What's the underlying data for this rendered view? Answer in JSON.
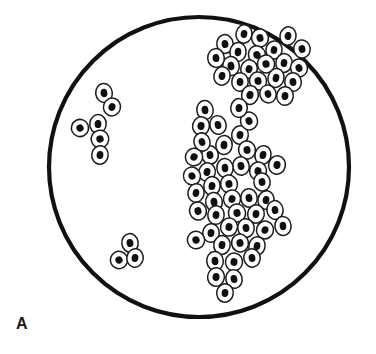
{
  "figure": {
    "panel_label": "A",
    "caption_text": "",
    "canvas": {
      "width": 376,
      "height": 354
    },
    "background_color": "#ffffff"
  },
  "field_of_view": {
    "shape": "circle",
    "center_x": 199,
    "center_y": 167,
    "radius": 150,
    "stroke_color": "#111111",
    "stroke_width": 4.2,
    "fill_color": "#ffffff"
  },
  "cell_style": {
    "membrane_color": "#1b1b1b",
    "membrane_width": 1.5,
    "cytoplasm_color": "#ffffff",
    "nucleus_color": "#101010"
  },
  "clusters": [
    {
      "name": "upper-right-cluster",
      "cell_count": 22,
      "cells": [
        {
          "cx": 225,
          "cy": 44,
          "rx": 8.2,
          "ry": 9.4,
          "rot": -8,
          "nrx": 3.4,
          "nry": 4.1
        },
        {
          "cx": 244,
          "cy": 34,
          "rx": 8.0,
          "ry": 9.2,
          "rot": 12,
          "nrx": 3.3,
          "nry": 4.0
        },
        {
          "cx": 260,
          "cy": 38,
          "rx": 8.4,
          "ry": 9.0,
          "rot": -14,
          "nrx": 3.5,
          "nry": 3.9
        },
        {
          "cx": 238,
          "cy": 52,
          "rx": 8.1,
          "ry": 9.5,
          "rot": 6,
          "nrx": 3.3,
          "nry": 4.2
        },
        {
          "cx": 257,
          "cy": 55,
          "rx": 8.5,
          "ry": 9.3,
          "rot": -20,
          "nrx": 3.6,
          "nry": 4.0
        },
        {
          "cx": 274,
          "cy": 50,
          "rx": 8.0,
          "ry": 9.1,
          "rot": 10,
          "nrx": 3.3,
          "nry": 3.9
        },
        {
          "cx": 231,
          "cy": 66,
          "rx": 8.3,
          "ry": 9.6,
          "rot": -6,
          "nrx": 3.4,
          "nry": 4.2
        },
        {
          "cx": 249,
          "cy": 69,
          "rx": 8.2,
          "ry": 9.2,
          "rot": 16,
          "nrx": 3.4,
          "nry": 4.0
        },
        {
          "cx": 266,
          "cy": 64,
          "rx": 8.6,
          "ry": 8.9,
          "rot": -12,
          "nrx": 3.6,
          "nry": 3.8
        },
        {
          "cx": 284,
          "cy": 63,
          "rx": 8.1,
          "ry": 9.4,
          "rot": 8,
          "nrx": 3.3,
          "nry": 4.1
        },
        {
          "cx": 299,
          "cy": 68,
          "rx": 8.4,
          "ry": 9.0,
          "rot": -18,
          "nrx": 3.5,
          "nry": 3.9
        },
        {
          "cx": 240,
          "cy": 82,
          "rx": 8.2,
          "ry": 9.3,
          "rot": 4,
          "nrx": 3.4,
          "nry": 4.0
        },
        {
          "cx": 258,
          "cy": 81,
          "rx": 8.5,
          "ry": 9.1,
          "rot": -10,
          "nrx": 3.5,
          "nry": 3.9
        },
        {
          "cx": 276,
          "cy": 78,
          "rx": 8.0,
          "ry": 9.5,
          "rot": 14,
          "nrx": 3.3,
          "nry": 4.2
        },
        {
          "cx": 293,
          "cy": 82,
          "rx": 8.3,
          "ry": 9.2,
          "rot": -6,
          "nrx": 3.4,
          "nry": 4.0
        },
        {
          "cx": 250,
          "cy": 95,
          "rx": 8.4,
          "ry": 9.4,
          "rot": 10,
          "nrx": 3.5,
          "nry": 4.1
        },
        {
          "cx": 268,
          "cy": 94,
          "rx": 8.1,
          "ry": 9.0,
          "rot": -16,
          "nrx": 3.3,
          "nry": 3.9
        },
        {
          "cx": 285,
          "cy": 96,
          "rx": 8.3,
          "ry": 9.3,
          "rot": 6,
          "nrx": 3.4,
          "nry": 4.0
        },
        {
          "cx": 302,
          "cy": 49,
          "rx": 8.2,
          "ry": 9.1,
          "rot": -9,
          "nrx": 3.4,
          "nry": 3.9
        },
        {
          "cx": 288,
          "cy": 36,
          "rx": 8.0,
          "ry": 9.2,
          "rot": 11,
          "nrx": 3.3,
          "nry": 4.0
        },
        {
          "cx": 216,
          "cy": 58,
          "rx": 8.3,
          "ry": 9.4,
          "rot": -5,
          "nrx": 3.4,
          "nry": 4.1
        },
        {
          "cx": 222,
          "cy": 76,
          "rx": 8.1,
          "ry": 9.2,
          "rot": 13,
          "nrx": 3.3,
          "nry": 4.0
        }
      ]
    },
    {
      "name": "left-cluster",
      "cell_count": 6,
      "cells": [
        {
          "cx": 104,
          "cy": 93,
          "rx": 8.3,
          "ry": 9.5,
          "rot": -6,
          "nrx": 3.4,
          "nry": 4.2
        },
        {
          "cx": 112,
          "cy": 107,
          "rx": 8.5,
          "ry": 9.0,
          "rot": 18,
          "nrx": 3.5,
          "nry": 3.9
        },
        {
          "cx": 80,
          "cy": 128,
          "rx": 8.6,
          "ry": 8.6,
          "rot": -26,
          "nrx": 3.6,
          "nry": 3.6
        },
        {
          "cx": 98,
          "cy": 124,
          "rx": 8.2,
          "ry": 9.4,
          "rot": 4,
          "nrx": 3.4,
          "nry": 4.1
        },
        {
          "cx": 100,
          "cy": 139,
          "rx": 8.8,
          "ry": 8.8,
          "rot": -14,
          "nrx": 3.7,
          "nry": 3.7
        },
        {
          "cx": 100,
          "cy": 155,
          "rx": 8.2,
          "ry": 9.3,
          "rot": 8,
          "nrx": 3.4,
          "nry": 4.0
        }
      ]
    },
    {
      "name": "lower-left-cluster",
      "cell_count": 3,
      "cells": [
        {
          "cx": 130,
          "cy": 243,
          "rx": 8.2,
          "ry": 9.4,
          "rot": -8,
          "nrx": 3.4,
          "nry": 4.1
        },
        {
          "cx": 119,
          "cy": 260,
          "rx": 8.6,
          "ry": 8.7,
          "rot": -28,
          "nrx": 3.6,
          "nry": 3.7
        },
        {
          "cx": 135,
          "cy": 258,
          "rx": 8.2,
          "ry": 9.3,
          "rot": 10,
          "nrx": 3.4,
          "nry": 4.0
        }
      ]
    },
    {
      "name": "central-cluster",
      "cell_count": 46,
      "cells": [
        {
          "cx": 205,
          "cy": 110,
          "rx": 8.2,
          "ry": 9.5,
          "rot": -6,
          "nrx": 3.4,
          "nry": 4.2
        },
        {
          "cx": 201,
          "cy": 126,
          "rx": 8.4,
          "ry": 9.2,
          "rot": 12,
          "nrx": 3.5,
          "nry": 4.0
        },
        {
          "cx": 218,
          "cy": 125,
          "rx": 8.1,
          "ry": 9.4,
          "rot": -14,
          "nrx": 3.3,
          "nry": 4.1
        },
        {
          "cx": 240,
          "cy": 135,
          "rx": 8.3,
          "ry": 9.3,
          "rot": 8,
          "nrx": 3.4,
          "nry": 4.0
        },
        {
          "cx": 249,
          "cy": 121,
          "rx": 8.5,
          "ry": 9.0,
          "rot": -18,
          "nrx": 3.5,
          "nry": 3.9
        },
        {
          "cx": 224,
          "cy": 145,
          "rx": 8.2,
          "ry": 9.6,
          "rot": 5,
          "nrx": 3.4,
          "nry": 4.2
        },
        {
          "cx": 247,
          "cy": 150,
          "rx": 8.4,
          "ry": 9.1,
          "rot": -10,
          "nrx": 3.5,
          "nry": 3.9
        },
        {
          "cx": 263,
          "cy": 155,
          "rx": 8.0,
          "ry": 9.4,
          "rot": 15,
          "nrx": 3.3,
          "nry": 4.1
        },
        {
          "cx": 210,
          "cy": 155,
          "rx": 8.3,
          "ry": 9.2,
          "rot": -7,
          "nrx": 3.4,
          "nry": 4.0
        },
        {
          "cx": 194,
          "cy": 157,
          "rx": 8.6,
          "ry": 8.8,
          "rot": 22,
          "nrx": 3.6,
          "nry": 3.7
        },
        {
          "cx": 241,
          "cy": 166,
          "rx": 8.2,
          "ry": 9.3,
          "rot": -12,
          "nrx": 3.4,
          "nry": 4.0
        },
        {
          "cx": 258,
          "cy": 171,
          "rx": 8.4,
          "ry": 9.0,
          "rot": 9,
          "nrx": 3.5,
          "nry": 3.9
        },
        {
          "cx": 225,
          "cy": 168,
          "rx": 8.1,
          "ry": 9.5,
          "rot": -5,
          "nrx": 3.3,
          "nry": 4.2
        },
        {
          "cx": 207,
          "cy": 172,
          "rx": 8.3,
          "ry": 9.2,
          "rot": 14,
          "nrx": 3.4,
          "nry": 4.0
        },
        {
          "cx": 192,
          "cy": 176,
          "rx": 8.5,
          "ry": 8.9,
          "rot": -20,
          "nrx": 3.5,
          "nry": 3.8
        },
        {
          "cx": 212,
          "cy": 186,
          "rx": 8.2,
          "ry": 9.4,
          "rot": 6,
          "nrx": 3.4,
          "nry": 4.1
        },
        {
          "cx": 229,
          "cy": 184,
          "rx": 8.4,
          "ry": 9.1,
          "rot": -11,
          "nrx": 3.5,
          "nry": 3.9
        },
        {
          "cx": 196,
          "cy": 193,
          "rx": 8.1,
          "ry": 9.3,
          "rot": 10,
          "nrx": 3.3,
          "nry": 4.0
        },
        {
          "cx": 214,
          "cy": 202,
          "rx": 8.3,
          "ry": 9.5,
          "rot": -8,
          "nrx": 3.4,
          "nry": 4.2
        },
        {
          "cx": 232,
          "cy": 199,
          "rx": 8.5,
          "ry": 9.0,
          "rot": 16,
          "nrx": 3.5,
          "nry": 3.9
        },
        {
          "cx": 249,
          "cy": 198,
          "rx": 8.2,
          "ry": 9.2,
          "rot": -6,
          "nrx": 3.4,
          "nry": 4.0
        },
        {
          "cx": 266,
          "cy": 200,
          "rx": 8.0,
          "ry": 9.4,
          "rot": 11,
          "nrx": 3.3,
          "nry": 4.1
        },
        {
          "cx": 198,
          "cy": 211,
          "rx": 8.4,
          "ry": 9.1,
          "rot": -15,
          "nrx": 3.5,
          "nry": 3.9
        },
        {
          "cx": 216,
          "cy": 215,
          "rx": 8.2,
          "ry": 9.3,
          "rot": 7,
          "nrx": 3.4,
          "nry": 4.0
        },
        {
          "cx": 237,
          "cy": 213,
          "rx": 8.6,
          "ry": 9.0,
          "rot": -13,
          "nrx": 3.6,
          "nry": 3.9
        },
        {
          "cx": 256,
          "cy": 214,
          "rx": 8.3,
          "ry": 9.2,
          "rot": 9,
          "nrx": 3.4,
          "nry": 4.0
        },
        {
          "cx": 275,
          "cy": 210,
          "rx": 8.1,
          "ry": 9.4,
          "rot": -7,
          "nrx": 3.3,
          "nry": 4.1
        },
        {
          "cx": 229,
          "cy": 227,
          "rx": 8.4,
          "ry": 9.1,
          "rot": 13,
          "nrx": 3.5,
          "nry": 3.9
        },
        {
          "cx": 246,
          "cy": 228,
          "rx": 8.2,
          "ry": 9.3,
          "rot": -9,
          "nrx": 3.4,
          "nry": 4.0
        },
        {
          "cx": 265,
          "cy": 230,
          "rx": 8.5,
          "ry": 8.9,
          "rot": 17,
          "nrx": 3.5,
          "nry": 3.8
        },
        {
          "cx": 283,
          "cy": 226,
          "rx": 8.1,
          "ry": 9.5,
          "rot": -5,
          "nrx": 3.3,
          "nry": 4.2
        },
        {
          "cx": 211,
          "cy": 233,
          "rx": 8.3,
          "ry": 9.2,
          "rot": 6,
          "nrx": 3.4,
          "nry": 4.0
        },
        {
          "cx": 196,
          "cy": 240,
          "rx": 8.6,
          "ry": 8.7,
          "rot": -24,
          "nrx": 3.6,
          "nry": 3.7
        },
        {
          "cx": 222,
          "cy": 245,
          "rx": 8.2,
          "ry": 9.4,
          "rot": 8,
          "nrx": 3.4,
          "nry": 4.1
        },
        {
          "cx": 240,
          "cy": 243,
          "rx": 8.4,
          "ry": 9.0,
          "rot": -12,
          "nrx": 3.5,
          "nry": 3.9
        },
        {
          "cx": 257,
          "cy": 246,
          "rx": 8.1,
          "ry": 9.3,
          "rot": 14,
          "nrx": 3.3,
          "nry": 4.0
        },
        {
          "cx": 215,
          "cy": 261,
          "rx": 8.3,
          "ry": 9.5,
          "rot": -6,
          "nrx": 3.4,
          "nry": 4.2
        },
        {
          "cx": 234,
          "cy": 262,
          "rx": 8.5,
          "ry": 9.0,
          "rot": 11,
          "nrx": 3.5,
          "nry": 3.9
        },
        {
          "cx": 252,
          "cy": 258,
          "rx": 8.2,
          "ry": 9.2,
          "rot": -10,
          "nrx": 3.4,
          "nry": 4.0
        },
        {
          "cx": 216,
          "cy": 277,
          "rx": 8.4,
          "ry": 9.3,
          "rot": 7,
          "nrx": 3.5,
          "nry": 4.0
        },
        {
          "cx": 234,
          "cy": 279,
          "rx": 8.1,
          "ry": 9.4,
          "rot": -14,
          "nrx": 3.3,
          "nry": 4.1
        },
        {
          "cx": 225,
          "cy": 293,
          "rx": 8.3,
          "ry": 9.2,
          "rot": 9,
          "nrx": 3.4,
          "nry": 4.0
        },
        {
          "cx": 262,
          "cy": 182,
          "rx": 8.2,
          "ry": 9.1,
          "rot": -8,
          "nrx": 3.4,
          "nry": 3.9
        },
        {
          "cx": 277,
          "cy": 165,
          "rx": 8.4,
          "ry": 9.3,
          "rot": 12,
          "nrx": 3.5,
          "nry": 4.0
        },
        {
          "cx": 202,
          "cy": 142,
          "rx": 8.0,
          "ry": 9.2,
          "rot": -17,
          "nrx": 3.3,
          "nry": 4.0
        },
        {
          "cx": 239,
          "cy": 108,
          "rx": 8.3,
          "ry": 9.4,
          "rot": 5,
          "nrx": 3.4,
          "nry": 4.1
        }
      ]
    }
  ]
}
